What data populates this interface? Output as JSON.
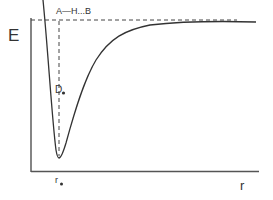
{
  "diagram": {
    "type": "potential-energy-curve",
    "y_axis_label": "E",
    "x_axis_label": "r",
    "dissociation_label": "A—H...B",
    "well_depth_label": "D",
    "well_depth_subscript": "e",
    "equilibrium_label": "r",
    "equilibrium_subscript": "e",
    "colors": {
      "line": "#333333",
      "background": "#ffffff"
    }
  }
}
